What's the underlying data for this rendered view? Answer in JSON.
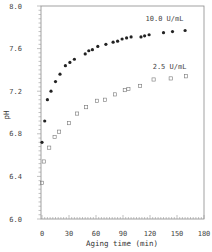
{
  "chart_data": {
    "type": "scatter",
    "title": "",
    "xlabel": "Aging time (min)",
    "ylabel": "pH",
    "xlim": [
      0,
      180
    ],
    "ylim": [
      6.0,
      8.0
    ],
    "xticks": [
      0,
      30,
      60,
      90,
      120,
      150,
      180
    ],
    "xtick_labels": [
      "0",
      "30",
      "60",
      "90",
      "120",
      "150",
      "180"
    ],
    "yticks": [
      6.0,
      6.4,
      6.8,
      7.2,
      7.6,
      8.0
    ],
    "ytick_labels": [
      "6.0",
      "6.4",
      "6.8",
      "7.2",
      "7.6",
      "8.0"
    ],
    "grid": false,
    "legend_position": "inline labels (upper right)",
    "series": [
      {
        "name": "10.0 U/mL",
        "marker": "filled-circle",
        "color": "#222222",
        "label_pos": [
          115,
          7.88
        ],
        "x": [
          0,
          3,
          6,
          10,
          15,
          20,
          26,
          31,
          36,
          48,
          52,
          56,
          62,
          71,
          79,
          84,
          89,
          94,
          99,
          110,
          114,
          119,
          135,
          145,
          159
        ],
        "y": [
          6.72,
          6.92,
          7.12,
          7.2,
          7.29,
          7.36,
          7.44,
          7.47,
          7.5,
          7.55,
          7.58,
          7.59,
          7.62,
          7.64,
          7.66,
          7.67,
          7.69,
          7.7,
          7.71,
          7.71,
          7.72,
          7.73,
          7.75,
          7.76,
          7.77
        ]
      },
      {
        "name": "2.5 U/mL",
        "marker": "open-square",
        "color": "#777777",
        "label_pos": [
          123,
          7.43
        ],
        "x": [
          0,
          2,
          8,
          14,
          19,
          30,
          39,
          49,
          61,
          70,
          81,
          92,
          96,
          109,
          124,
          143,
          160
        ],
        "y": [
          6.34,
          6.54,
          6.67,
          6.77,
          6.82,
          6.9,
          6.99,
          7.05,
          7.11,
          7.12,
          7.17,
          7.21,
          7.22,
          7.25,
          7.31,
          7.32,
          7.34
        ]
      }
    ]
  }
}
